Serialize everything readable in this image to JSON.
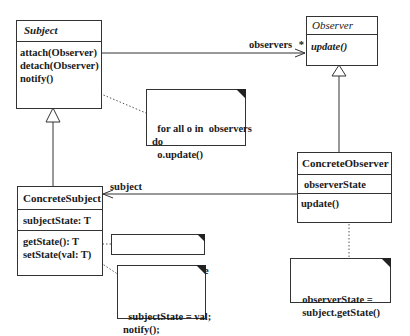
{
  "classes": {
    "subject": {
      "name": "Subject",
      "abstract": true,
      "attributes": [],
      "operations": [
        "attach(Observer)",
        "detach(Observer)",
        "notify()"
      ]
    },
    "observer": {
      "name": "Observer",
      "abstract": true,
      "attributes": [],
      "operations": [
        "update()"
      ]
    },
    "concrete_subject": {
      "name": "ConcreteSubject",
      "attributes": [
        "subjectState: T"
      ],
      "operations": [
        "getState(): T",
        "setState(val: T)"
      ]
    },
    "concrete_observer": {
      "name": "ConcreteObserver",
      "attributes": [
        "observerState"
      ],
      "operations": [
        "update()"
      ]
    }
  },
  "notes": {
    "notify_note": "for all o in  observers\ndo\n  o.update()",
    "get_state_note": "return subjectState",
    "set_state_note": "subjectState = val;\nnotify();",
    "update_note": "observerState =\n  subject.getState()"
  },
  "associations": {
    "observers": {
      "label": "observers",
      "multiplicity": "*"
    },
    "subject": {
      "label": "subject"
    }
  },
  "colors": {
    "line": "#333333",
    "text": "#1a1a1a",
    "background": "#ffffff"
  }
}
